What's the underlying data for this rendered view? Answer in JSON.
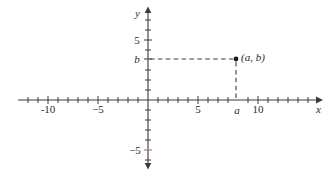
{
  "figure": {
    "kind": "cartesian-coordinate-plane",
    "background_color": "#ffffff",
    "ink_color": "#2b2b2b",
    "accent_tick_color": "#b07070"
  },
  "axes": {
    "x_axis_name": "x",
    "y_axis_name": "y",
    "origin_px": {
      "x": 148,
      "y": 100
    },
    "unit_px": 10.0,
    "x_range_px": {
      "start": 18,
      "end": 322
    },
    "y_range_px": {
      "start": 8,
      "end": 168
    },
    "x_visible_range": [
      -13,
      17.4
    ],
    "y_visible_range": [
      -6.8,
      9.2
    ],
    "grid": false
  },
  "x_ticks": [
    {
      "label": "",
      "value": -13
    },
    {
      "label": "",
      "value": -12
    },
    {
      "label": "",
      "value": -11
    },
    {
      "label": "-10",
      "value": -10,
      "px": 48
    },
    {
      "label": "",
      "value": -9
    },
    {
      "label": "",
      "value": -8
    },
    {
      "label": "",
      "value": -7
    },
    {
      "label": "",
      "value": -6
    },
    {
      "label": "−5",
      "value": -5,
      "px": 98
    },
    {
      "label": "",
      "value": -4
    },
    {
      "label": "",
      "value": -3
    },
    {
      "label": "",
      "value": -2
    },
    {
      "label": "",
      "value": -1
    },
    {
      "label": "",
      "value": 1
    },
    {
      "label": "",
      "value": 2
    },
    {
      "label": "",
      "value": 3
    },
    {
      "label": "",
      "value": 4
    },
    {
      "label": "5",
      "value": 5,
      "px": 198
    },
    {
      "label": "",
      "value": 6
    },
    {
      "label": "",
      "value": 7
    },
    {
      "label": "a",
      "value": 8.8,
      "px": 237,
      "italic": true
    },
    {
      "label": "10",
      "value": 10,
      "px": 258
    },
    {
      "label": "",
      "value": 11
    },
    {
      "label": "",
      "value": 12
    },
    {
      "label": "",
      "value": 13
    },
    {
      "label": "",
      "value": 14
    },
    {
      "label": "",
      "value": 15
    },
    {
      "label": "",
      "value": 16
    },
    {
      "label": "",
      "value": 17
    }
  ],
  "x_tick_labels": [
    {
      "text": "-10",
      "left_px": 48,
      "top_px": 104
    },
    {
      "text": "−5",
      "left_px": 98,
      "top_px": 104
    },
    {
      "text": "5",
      "left_px": 198,
      "top_px": 104
    },
    {
      "text": "a",
      "left_px": 237,
      "top_px": 104,
      "italic": true
    },
    {
      "text": "10",
      "left_px": 258,
      "top_px": 104
    }
  ],
  "y_tick_labels": [
    {
      "text": "5",
      "left_px": 137,
      "top_px": 36
    },
    {
      "text": "b",
      "left_px": 137,
      "top_px": 54,
      "italic": true
    },
    {
      "text": "−5",
      "left_px": 133,
      "top_px": 143
    }
  ],
  "point": {
    "label": "(a, b)",
    "x_symbol": "a",
    "y_symbol": "b",
    "px": {
      "x": 236,
      "y": 59
    },
    "label_px": {
      "x": 241,
      "y": 52
    },
    "dot_radius_px": 2.4
  },
  "guide_lines": {
    "horizontal": {
      "name": "horizontal-dashed-guide",
      "from_px": {
        "x": 149,
        "y": 59
      },
      "to_px": {
        "x": 234,
        "y": 59
      },
      "style": "dashed"
    },
    "vertical": {
      "name": "vertical-dashed-guide",
      "from_px": {
        "x": 236,
        "y": 61
      },
      "to_px": {
        "x": 236,
        "y": 99
      },
      "style": "dashed"
    }
  },
  "axis_labels": {
    "x": {
      "text": "x",
      "left_px": 318,
      "top_px": 104
    },
    "y": {
      "text": "y",
      "left_px": 137,
      "top_px": 8
    }
  }
}
